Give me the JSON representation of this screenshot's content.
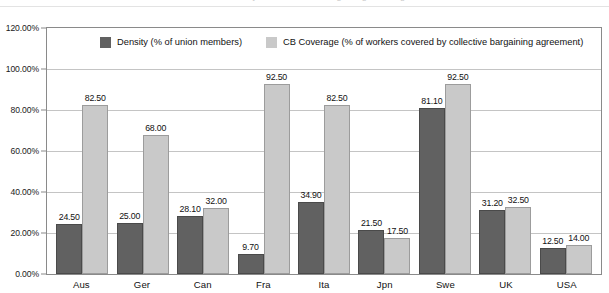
{
  "chart_data": {
    "type": "bar",
    "title": "",
    "xlabel": "",
    "ylabel": "",
    "ylim": [
      0,
      120
    ],
    "ytick_step": 20,
    "grid": true,
    "legend_position": "top-left-inside",
    "value_format": "0.00",
    "axis_format": "0.00%",
    "categories": [
      "Aus",
      "Ger",
      "Can",
      "Fra",
      "Ita",
      "Jpn",
      "Swe",
      "UK",
      "USA"
    ],
    "series": [
      {
        "name": "Density (% of union members)",
        "color": "#616161",
        "values": [
          24.5,
          25.0,
          28.1,
          9.7,
          34.9,
          21.5,
          81.1,
          31.2,
          12.5
        ]
      },
      {
        "name": "CB Coverage (% of workers covered by collective bargaining agreement)",
        "color": "#c9c9c9",
        "values": [
          82.5,
          68.0,
          32.0,
          92.5,
          82.5,
          17.5,
          92.5,
          32.5,
          14.0
        ]
      }
    ],
    "ytick_labels": [
      "120.00%",
      "100.00%",
      "80.00%",
      "60.00%",
      "40.00%",
      "20.00%",
      "0.00%"
    ],
    "ytick_values": [
      120,
      100,
      80,
      60,
      40,
      20,
      0
    ]
  },
  "title_remnant": "Union Density and Collective Bargaining Coverage",
  "colors": {
    "density": "#616161",
    "coverage": "#c9c9c9",
    "grid": "#c4c4c4",
    "frame": "#8a8a8a",
    "background": "#ffffff"
  }
}
